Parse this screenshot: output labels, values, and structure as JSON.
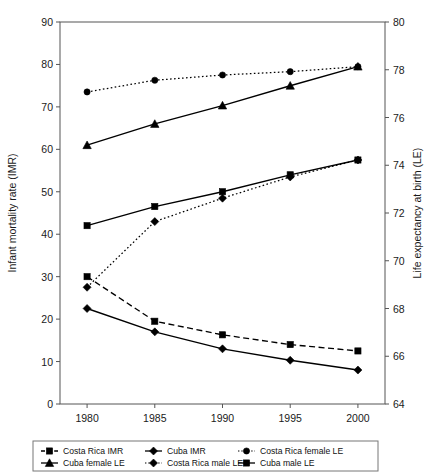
{
  "chart_data": {
    "type": "line",
    "title": "",
    "subtitle": "",
    "x": [
      1980,
      1985,
      1990,
      1995,
      2000
    ],
    "xlabel": "",
    "xtick_labels": [
      "1980",
      "1985",
      "1990",
      "1995",
      "2000"
    ],
    "xlim": [
      1978,
      2002
    ],
    "ylabel": "Infant mortality rate (IMR)",
    "ylim": [
      0,
      90
    ],
    "ytick_labels": [
      "0",
      "10",
      "20",
      "30",
      "40",
      "50",
      "60",
      "70",
      "80",
      "90"
    ],
    "yticks": [
      0,
      10,
      20,
      30,
      40,
      50,
      60,
      70,
      80,
      90
    ],
    "y2label": "Life expectancy at birth (LE)",
    "y2lim": [
      64,
      80
    ],
    "y2tick_labels": [
      "64",
      "66",
      "68",
      "70",
      "72",
      "74",
      "76",
      "78",
      "80"
    ],
    "y2ticks": [
      64,
      66,
      68,
      70,
      72,
      74,
      76,
      78,
      80
    ],
    "grid": false,
    "legend_position": "bottom",
    "series": [
      {
        "name": "Costa Rica IMR",
        "axis": "left",
        "marker": "square",
        "linestyle": "dashed",
        "color": "#000000",
        "values": [
          30.0,
          19.5,
          16.3,
          14.0,
          12.5
        ]
      },
      {
        "name": "Cuba IMR",
        "axis": "left",
        "marker": "diamond",
        "linestyle": "solid",
        "color": "#000000",
        "values": [
          22.5,
          17.0,
          13.0,
          10.3,
          8.0
        ]
      },
      {
        "name": "Costa Rica female LE",
        "axis": "right",
        "marker": "circle",
        "linestyle": "dotted",
        "color": "#000000",
        "values": [
          77.07,
          77.56,
          77.78,
          77.92,
          78.13
        ]
      },
      {
        "name": "Cuba female LE",
        "axis": "right",
        "marker": "triangle",
        "linestyle": "solid",
        "color": "#000000",
        "values": [
          74.84,
          75.73,
          76.5,
          77.33,
          78.13
        ]
      },
      {
        "name": "Costa Rica male LE",
        "axis": "right",
        "marker": "diamond",
        "linestyle": "dotted",
        "color": "#000000",
        "values": [
          68.89,
          71.64,
          72.62,
          73.51,
          74.22
        ]
      },
      {
        "name": "Cuba male LE",
        "axis": "right",
        "marker": "square",
        "linestyle": "solid",
        "color": "#000000",
        "values": [
          71.47,
          72.27,
          72.89,
          73.6,
          74.22
        ]
      }
    ]
  },
  "legend": {
    "entries": [
      {
        "label": "Costa Rica IMR",
        "marker": "square",
        "linestyle": "dashed"
      },
      {
        "label": "Cuba IMR",
        "marker": "diamond",
        "linestyle": "solid"
      },
      {
        "label": "Costa Rica female LE",
        "marker": "circle",
        "linestyle": "dotted"
      },
      {
        "label": "Cuba female LE",
        "marker": "triangle",
        "linestyle": "solid"
      },
      {
        "label": "Costa Rica male LE",
        "marker": "diamond",
        "linestyle": "dotted"
      },
      {
        "label": "Cuba male LE",
        "marker": "square",
        "linestyle": "solid"
      }
    ]
  },
  "colors": {
    "ink": "#000000",
    "frame": "#555555",
    "background": "#ffffff"
  }
}
